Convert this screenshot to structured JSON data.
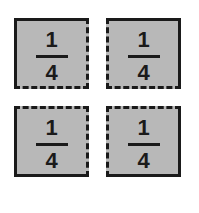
{
  "diagram": {
    "fill_color": "#b8b8b8",
    "border_color": "#1a1a1a",
    "pieces": [
      {
        "position": "top-left",
        "numerator": "1",
        "denominator": "4"
      },
      {
        "position": "top-right",
        "numerator": "1",
        "denominator": "4"
      },
      {
        "position": "bottom-left",
        "numerator": "1",
        "denominator": "4"
      },
      {
        "position": "bottom-right",
        "numerator": "1",
        "denominator": "4"
      }
    ]
  }
}
